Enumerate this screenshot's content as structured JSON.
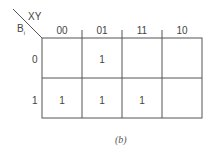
{
  "kmap": {
    "corner": {
      "col_var": "XY",
      "row_var": "B",
      "row_var_sub": "i"
    },
    "col_headers": [
      "00",
      "01",
      "11",
      "10"
    ],
    "row_headers": [
      "0",
      "1"
    ],
    "cells": [
      [
        "",
        "1",
        "",
        ""
      ],
      [
        "1",
        "1",
        "1",
        ""
      ]
    ],
    "caption": "(b)"
  }
}
